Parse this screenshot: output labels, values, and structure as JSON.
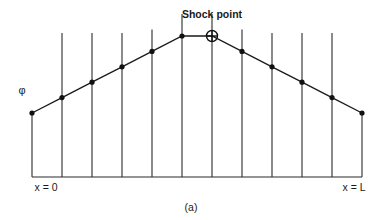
{
  "figure": {
    "panel_label": "(a)",
    "y_axis_symbol": "φ",
    "left_boundary_label": "x = 0",
    "right_boundary_label": "x = L",
    "shock_label": "Shock point",
    "colors": {
      "ink": "#1a1a1a",
      "background": "#ffffff"
    }
  },
  "chart_data": {
    "type": "line",
    "title": "",
    "xlabel": "",
    "ylabel": "φ",
    "x_labels": {
      "start": "x = 0",
      "end": "x = L"
    },
    "x": [
      0,
      1,
      2,
      3,
      4,
      5,
      6,
      7,
      8,
      9,
      10,
      11
    ],
    "series": [
      {
        "name": "φ",
        "values": [
          0,
          1,
          2,
          3,
          4,
          5,
          5,
          4,
          3,
          2,
          1,
          0
        ]
      }
    ],
    "shock_point_index": 6,
    "annotations": [
      {
        "text": "Shock point",
        "at_index": 6
      }
    ],
    "xlim": [
      0,
      11
    ],
    "ylim": [
      0,
      5
    ],
    "grid": "vertical lines at each node",
    "legend": "none"
  }
}
